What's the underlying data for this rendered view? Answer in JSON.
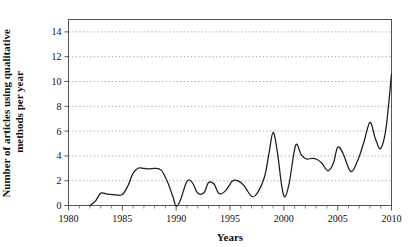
{
  "chart_data": {
    "type": "line",
    "title": "",
    "xlabel": "Years",
    "ylabel": "Number of articles using qualitative methods per year",
    "xlim": [
      1980,
      2010
    ],
    "ylim": [
      0,
      15
    ],
    "grid": true,
    "legend": false,
    "line_color": "#1a1a1a",
    "x_ticks": [
      1980,
      1985,
      1990,
      1995,
      2000,
      2005,
      2010
    ],
    "x_tick_labels": [
      "1980",
      "1985",
      "1990",
      "1995",
      "2000",
      "2005",
      "2010"
    ],
    "x_minor_tick_step": 1,
    "y_ticks": [
      0,
      2,
      4,
      6,
      8,
      10,
      12,
      14
    ],
    "y_tick_labels": [
      "0",
      "2",
      "4",
      "6",
      "8",
      "10",
      "12",
      "14"
    ],
    "x": [
      1982,
      1983,
      1984,
      1985,
      1986,
      1987,
      1988,
      1989,
      1990,
      1991,
      1992,
      1993,
      1994,
      1995,
      1996,
      1997,
      1998,
      1999,
      2000,
      2001,
      2002,
      2003,
      2004,
      2005,
      2006,
      2007,
      2008,
      2009,
      2010
    ],
    "values": [
      0,
      1,
      1,
      1,
      3,
      3,
      3,
      2,
      0,
      2,
      1,
      2,
      1,
      2,
      2,
      1,
      2,
      6,
      1,
      5,
      4,
      4,
      3,
      5,
      3,
      4,
      7,
      5,
      11
    ],
    "series": [
      {
        "name": "Articles using qualitative methods",
        "values": [
          0,
          1,
          1,
          1,
          3,
          3,
          3,
          2,
          0,
          2,
          1,
          2,
          1,
          2,
          2,
          1,
          2,
          6,
          1,
          5,
          4,
          4,
          3,
          5,
          3,
          4,
          7,
          5,
          11
        ]
      }
    ],
    "smoothed_points": [
      [
        1982.0,
        0.0
      ],
      [
        1982.5,
        0.35
      ],
      [
        1983.0,
        1.0
      ],
      [
        1983.6,
        0.92
      ],
      [
        1984.4,
        0.86
      ],
      [
        1985.0,
        0.88
      ],
      [
        1985.5,
        1.55
      ],
      [
        1986.0,
        2.6
      ],
      [
        1986.5,
        3.02
      ],
      [
        1987.0,
        3.0
      ],
      [
        1987.5,
        2.95
      ],
      [
        1988.0,
        3.0
      ],
      [
        1988.6,
        2.85
      ],
      [
        1989.2,
        1.9
      ],
      [
        1989.7,
        0.7
      ],
      [
        1990.0,
        -0.05
      ],
      [
        1990.4,
        0.45
      ],
      [
        1991.0,
        1.95
      ],
      [
        1991.5,
        1.85
      ],
      [
        1992.0,
        1.0
      ],
      [
        1992.6,
        1.05
      ],
      [
        1993.0,
        1.85
      ],
      [
        1993.5,
        1.75
      ],
      [
        1994.0,
        0.95
      ],
      [
        1994.6,
        1.2
      ],
      [
        1995.2,
        1.95
      ],
      [
        1995.7,
        2.0
      ],
      [
        1996.3,
        1.6
      ],
      [
        1997.0,
        0.75
      ],
      [
        1997.5,
        0.95
      ],
      [
        1998.2,
        2.3
      ],
      [
        1998.6,
        4.1
      ],
      [
        1999.0,
        5.9
      ],
      [
        1999.4,
        4.3
      ],
      [
        1999.8,
        1.6
      ],
      [
        2000.1,
        0.7
      ],
      [
        2000.5,
        1.8
      ],
      [
        2001.1,
        4.85
      ],
      [
        2001.6,
        4.1
      ],
      [
        2002.1,
        3.75
      ],
      [
        2002.6,
        3.8
      ],
      [
        2003.0,
        3.75
      ],
      [
        2003.5,
        3.45
      ],
      [
        2004.1,
        2.8
      ],
      [
        2004.6,
        3.4
      ],
      [
        2005.0,
        4.7
      ],
      [
        2005.5,
        4.2
      ],
      [
        2006.2,
        2.75
      ],
      [
        2006.8,
        3.5
      ],
      [
        2007.4,
        5.0
      ],
      [
        2008.0,
        6.7
      ],
      [
        2008.5,
        5.4
      ],
      [
        2009.0,
        4.6
      ],
      [
        2009.5,
        6.3
      ],
      [
        2010.0,
        10.6
      ]
    ]
  }
}
